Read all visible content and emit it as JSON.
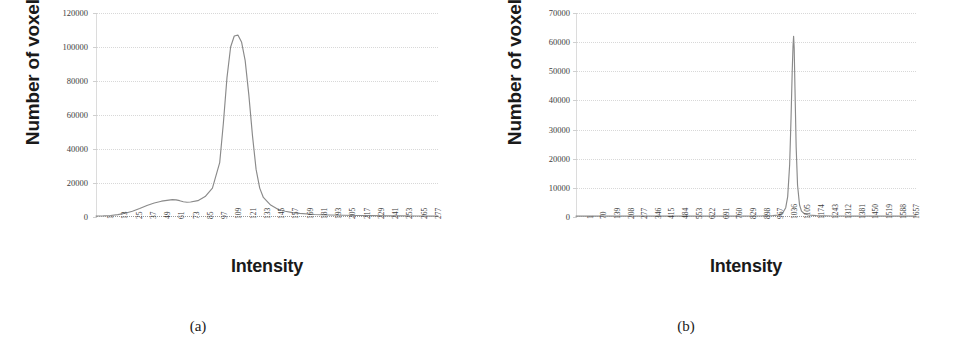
{
  "figure": {
    "panels": [
      {
        "caption": "(a)",
        "chart_data": {
          "type": "line",
          "title": "",
          "xlabel": "Intensity",
          "ylabel": "Number of voxels",
          "ylim": [
            0,
            120000
          ],
          "yticks": [
            0,
            20000,
            40000,
            60000,
            80000,
            100000,
            120000
          ],
          "ytick_labels": [
            "0",
            "20000",
            "40000",
            "60000",
            "80000",
            "100000",
            "120000"
          ],
          "xlim": [
            1,
            283
          ],
          "xtick_labels": [
            "1",
            "13",
            "25",
            "37",
            "49",
            "61",
            "73",
            "85",
            "97",
            "109",
            "121",
            "133",
            "145",
            "157",
            "169",
            "181",
            "193",
            "205",
            "217",
            "229",
            "241",
            "253",
            "265",
            "277"
          ],
          "grid": true,
          "legend": "none",
          "series": [
            {
              "name": "voxel intensity histogram",
              "x": [
                1,
                7,
                13,
                19,
                25,
                31,
                37,
                43,
                49,
                55,
                61,
                64,
                67,
                70,
                73,
                76,
                79,
                85,
                91,
                97,
                103,
                106,
                109,
                112,
                115,
                118,
                121,
                124,
                127,
                130,
                133,
                136,
                139,
                145,
                151,
                157,
                163,
                169,
                181,
                193,
                205,
                217,
                229,
                241,
                253,
                265,
                277,
                283
              ],
              "y": [
                600,
                700,
                900,
                1400,
                2200,
                3400,
                5000,
                6800,
                8200,
                9300,
                9900,
                10200,
                10100,
                9600,
                9000,
                8700,
                8800,
                9600,
                12000,
                17000,
                32000,
                55000,
                82000,
                100000,
                106500,
                107000,
                103000,
                92000,
                72000,
                48000,
                28000,
                17000,
                11500,
                7000,
                4600,
                3400,
                2600,
                2100,
                1500,
                1200,
                1000,
                900,
                800,
                700,
                650,
                600,
                550,
                500
              ]
            }
          ]
        }
      },
      {
        "caption": "(b)",
        "chart_data": {
          "type": "line",
          "title": "",
          "xlabel": "Intensity",
          "ylabel": "Number of voxels",
          "ylim": [
            0,
            70000
          ],
          "yticks": [
            0,
            10000,
            20000,
            30000,
            40000,
            50000,
            60000,
            70000
          ],
          "ytick_labels": [
            "0",
            "10000",
            "20000",
            "30000",
            "40000",
            "50000",
            "60000",
            "70000"
          ],
          "xlim": [
            1,
            1726
          ],
          "xtick_labels": [
            "1",
            "70",
            "139",
            "208",
            "277",
            "346",
            "415",
            "484",
            "553",
            "622",
            "691",
            "760",
            "829",
            "898",
            "967",
            "1036",
            "1105",
            "1174",
            "1243",
            "1312",
            "1381",
            "1450",
            "1519",
            "1588",
            "1657"
          ],
          "grid": true,
          "legend": "none",
          "series": [
            {
              "name": "voxel intensity histogram",
              "x": [
                1,
                140,
                280,
                420,
                560,
                700,
                840,
                940,
                1000,
                1030,
                1050,
                1065,
                1075,
                1085,
                1092,
                1098,
                1102,
                1105,
                1108,
                1112,
                1118,
                1125,
                1135,
                1145,
                1160,
                1180,
                1220,
                1300,
                1420,
                1560,
                1726
              ],
              "y": [
                300,
                300,
                300,
                300,
                300,
                300,
                320,
                360,
                450,
                700,
                1400,
                3200,
                7000,
                18000,
                34000,
                50000,
                58500,
                62000,
                58000,
                44000,
                24000,
                11000,
                4200,
                2000,
                1100,
                700,
                450,
                350,
                300,
                300,
                300
              ]
            }
          ]
        }
      }
    ]
  }
}
